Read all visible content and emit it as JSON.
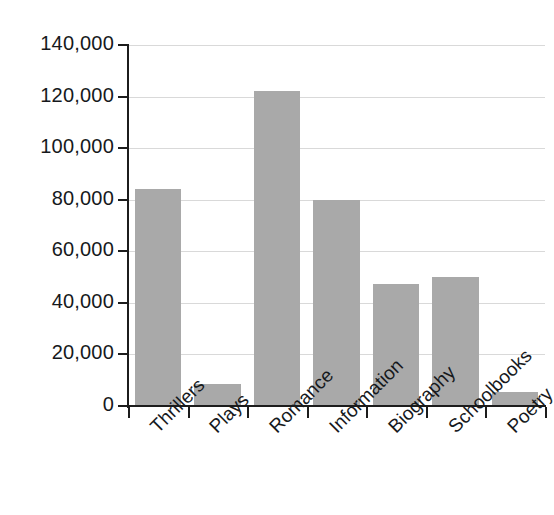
{
  "chart_data": {
    "type": "bar",
    "title": "",
    "subtitle": "",
    "xlabel": "",
    "ylabel": "",
    "categories": [
      "Thrillers",
      "Plays",
      "Romance",
      "Information",
      "Biography",
      "Schoolbooks",
      "Poetry"
    ],
    "values": [
      84000,
      8500,
      122000,
      80000,
      47500,
      50000,
      5500
    ],
    "series": [
      {
        "name": "Books sold",
        "values": [
          84000,
          8500,
          122000,
          80000,
          47500,
          50000,
          5500
        ]
      }
    ],
    "ylim": [
      0,
      140000
    ],
    "ytick_values": [
      0,
      20000,
      40000,
      60000,
      80000,
      100000,
      120000,
      140000
    ],
    "ytick_labels": [
      "0",
      "20,000",
      "40,000",
      "60,000",
      "80,000",
      "100,000",
      "120,000",
      "140,000"
    ],
    "grid": true,
    "grid_axis": "y",
    "legend": false,
    "legend_position": "none",
    "bar_color": "#a9a9a9",
    "axis_color": "#1c1c1c",
    "gridline_color": "#d9d9d9",
    "text_color": "#16191c",
    "xtick_label_rotation": -45,
    "annotations": []
  }
}
